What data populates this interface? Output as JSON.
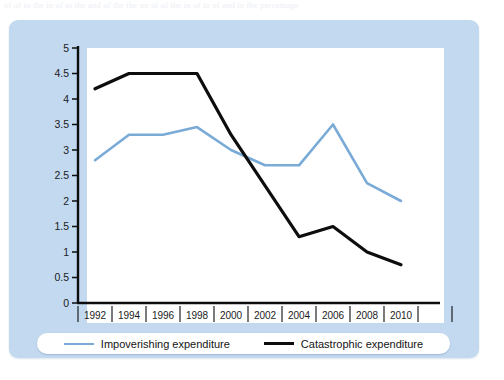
{
  "document_strip": {
    "text": "of of to the in of to the and of the the on of of the in of to of and in the percentage"
  },
  "colors": {
    "panel_background": "#c2d9f0",
    "plot_background": "#ffffff",
    "axis": "#0d0d0d",
    "series_impoverishing": "#7aabd7",
    "series_catastrophic": "#0d0d0d",
    "legend_background": "#ffffff"
  },
  "legend": {
    "position": "bottom",
    "entries": [
      {
        "label": "Impoverishing expenditure",
        "color": "#7aabd7",
        "marker": "line-swatch-blue"
      },
      {
        "label": "Catastrophic expenditure",
        "color": "#0d0d0d",
        "marker": "line-swatch-black"
      }
    ]
  },
  "chart_data": {
    "type": "line",
    "title": "",
    "subtitle": "",
    "xlabel": "",
    "ylabel": "",
    "categories": [
      "1992",
      "1994",
      "1996",
      "1998",
      "2000",
      "2002",
      "2004",
      "2006",
      "2008",
      "2010"
    ],
    "x": [
      1992,
      1994,
      1996,
      1998,
      2000,
      2002,
      2004,
      2006,
      2008,
      2010
    ],
    "xlim": [
      1991,
      2011
    ],
    "ylim": [
      0,
      5
    ],
    "ytick_labels": [
      "0",
      "0.5",
      "1",
      "1.5",
      "2",
      "2.5",
      "3",
      "3.5",
      "4",
      "4.5",
      "5"
    ],
    "ytick_values": [
      0,
      0.5,
      1,
      1.5,
      2,
      2.5,
      3,
      3.5,
      4,
      4.5,
      5
    ],
    "grid": false,
    "legend_position": "bottom",
    "series": [
      {
        "name": "Impoverishing expenditure",
        "color": "#7aabd7",
        "values": [
          2.8,
          3.3,
          3.3,
          3.45,
          3.0,
          2.7,
          2.7,
          3.5,
          2.35,
          2.0
        ]
      },
      {
        "name": "Catastrophic expenditure",
        "color": "#0d0d0d",
        "values": [
          4.2,
          4.5,
          4.5,
          4.5,
          3.3,
          2.3,
          1.3,
          1.5,
          1.0,
          0.75
        ]
      }
    ]
  }
}
